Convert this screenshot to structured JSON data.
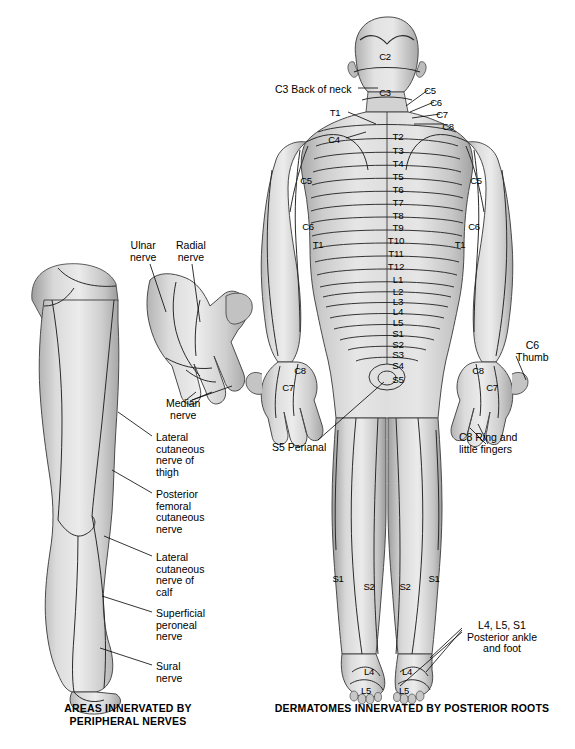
{
  "figure": {
    "title_left": "AREAS INNERVATED BY\nPERIPHERAL NERVES",
    "title_right": "DERMATOMES INNERVATED BY POSTERIOR ROOTS",
    "background_color": "#ffffff",
    "ink_color": "#000000",
    "skin_light": "#e8e8e8",
    "skin_mid": "#c9c9c9",
    "skin_dark": "#9a9a9a"
  },
  "left_panel": {
    "name": "peripheral-nerve-figure",
    "caption": "AREAS INNERVATED BY\nPERIPHERAL NERVES",
    "labels": [
      {
        "id": "ulnar-nerve",
        "text": "Ulnar\nnerve",
        "x": 130,
        "y": 240
      },
      {
        "id": "radial-nerve",
        "text": "Radial\nnerve",
        "x": 176,
        "y": 240
      },
      {
        "id": "median-nerve",
        "text": "Median\nnerve",
        "x": 166,
        "y": 398
      },
      {
        "id": "lateral-cutaneous-nerve-of-thigh",
        "text": "Lateral\ncutaneous\nnerve of\nthigh",
        "x": 156,
        "y": 432
      },
      {
        "id": "posterior-femoral-cutaneous-nerve",
        "text": "Posterior\nfemoral\ncutaneous\nnerve",
        "x": 156,
        "y": 489
      },
      {
        "id": "lateral-cutaneous-nerve-of-calf",
        "text": "Lateral\ncutaneous\nnerve of\ncalf",
        "x": 156,
        "y": 552
      },
      {
        "id": "superficial-peroneal-nerve",
        "text": "Superficial\nperoneal\nnerve",
        "x": 156,
        "y": 608
      },
      {
        "id": "sural-nerve",
        "text": "Sural\nnerve",
        "x": 156,
        "y": 661
      }
    ]
  },
  "right_panel": {
    "name": "dermatome-figure",
    "caption": "DERMATOMES INNERVATED BY POSTERIOR ROOTS",
    "callouts": [
      {
        "id": "c3-back-of-neck",
        "text": "C3 Back of neck",
        "x": 275,
        "y": 84
      },
      {
        "id": "s5-perianal",
        "text": "S5 Perianal",
        "x": 272,
        "y": 442
      },
      {
        "id": "c6-thumb",
        "text": "C6\nThumb",
        "x": 516,
        "y": 340
      },
      {
        "id": "c8-ring-and-little-fingers",
        "text": "C8 Ring and\nlittle fingers",
        "x": 459,
        "y": 432
      },
      {
        "id": "l4-l5-s1-posterior-ankle-and-foot",
        "text": "L4, L5, S1\nPosterior ankle\nand foot",
        "x": 467,
        "y": 620
      }
    ],
    "spine_segments": [
      {
        "label": "T2",
        "x": 398,
        "y": 132
      },
      {
        "label": "T3",
        "x": 398,
        "y": 146
      },
      {
        "label": "T4",
        "x": 398,
        "y": 159
      },
      {
        "label": "T5",
        "x": 398,
        "y": 172
      },
      {
        "label": "T6",
        "x": 398,
        "y": 185
      },
      {
        "label": "T7",
        "x": 398,
        "y": 198
      },
      {
        "label": "T8",
        "x": 398,
        "y": 211
      },
      {
        "label": "T9",
        "x": 398,
        "y": 223
      },
      {
        "label": "T10",
        "x": 396,
        "y": 236
      },
      {
        "label": "T11",
        "x": 396,
        "y": 249
      },
      {
        "label": "T12",
        "x": 396,
        "y": 262
      },
      {
        "label": "L1",
        "x": 398,
        "y": 275
      },
      {
        "label": "L2",
        "x": 398,
        "y": 287
      },
      {
        "label": "L3",
        "x": 398,
        "y": 297
      },
      {
        "label": "L4",
        "x": 398,
        "y": 307
      },
      {
        "label": "L5",
        "x": 398,
        "y": 318
      },
      {
        "label": "S1",
        "x": 398,
        "y": 329
      },
      {
        "label": "S2",
        "x": 398,
        "y": 340
      },
      {
        "label": "S3",
        "x": 398,
        "y": 350
      },
      {
        "label": "S4",
        "x": 398,
        "y": 361
      },
      {
        "label": "S5",
        "x": 398,
        "y": 375
      }
    ],
    "head_segments": [
      {
        "label": "C2",
        "x": 385,
        "y": 52
      },
      {
        "label": "C3",
        "x": 385,
        "y": 88
      }
    ],
    "neck_fan_labels": [
      {
        "label": "C5",
        "x": 430,
        "y": 86
      },
      {
        "label": "C6",
        "x": 436,
        "y": 98
      },
      {
        "label": "C7",
        "x": 442,
        "y": 110
      },
      {
        "label": "C8",
        "x": 448,
        "y": 122
      },
      {
        "label": "T1",
        "x": 335,
        "y": 108
      },
      {
        "label": "C4",
        "x": 334,
        "y": 135
      }
    ],
    "left_arm_segments": [
      {
        "label": "C5",
        "x": 306,
        "y": 176
      },
      {
        "label": "C6",
        "x": 308,
        "y": 222
      },
      {
        "label": "T1",
        "x": 318,
        "y": 240
      },
      {
        "label": "C8",
        "x": 300,
        "y": 366
      },
      {
        "label": "C7",
        "x": 288,
        "y": 383
      }
    ],
    "right_arm_segments": [
      {
        "label": "C5",
        "x": 476,
        "y": 176
      },
      {
        "label": "C6",
        "x": 474,
        "y": 222
      },
      {
        "label": "T1",
        "x": 460,
        "y": 240
      },
      {
        "label": "C8",
        "x": 478,
        "y": 366
      },
      {
        "label": "C7",
        "x": 492,
        "y": 383
      }
    ],
    "leg_segments": [
      {
        "label": "S1",
        "x": 338,
        "y": 574
      },
      {
        "label": "S2",
        "x": 369,
        "y": 582
      },
      {
        "label": "S2",
        "x": 405,
        "y": 582
      },
      {
        "label": "S1",
        "x": 434,
        "y": 574
      },
      {
        "label": "L4",
        "x": 369,
        "y": 667
      },
      {
        "label": "L5",
        "x": 366,
        "y": 686
      },
      {
        "label": "L4",
        "x": 407,
        "y": 667
      },
      {
        "label": "L5",
        "x": 404,
        "y": 686
      }
    ]
  }
}
